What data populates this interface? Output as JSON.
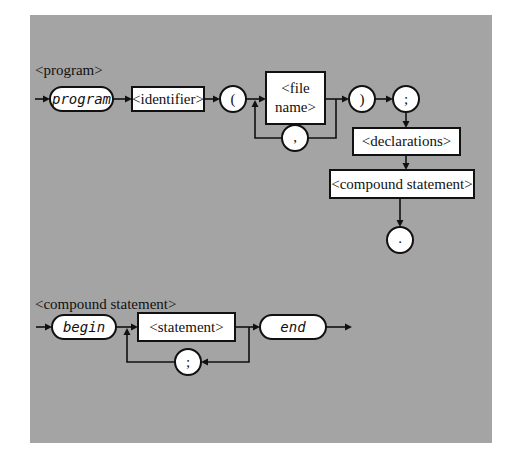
{
  "diagrams": {
    "program": {
      "title": "<program>",
      "keyword": "program",
      "identifier": "<identifier>",
      "open_paren": "(",
      "file_name_line1": "<file",
      "file_name_line2": "name>",
      "comma": ",",
      "close_paren": ")",
      "semicolon": ";",
      "declarations": "<declarations>",
      "compound_statement": "<compound statement>",
      "period": "."
    },
    "compound_statement": {
      "title": "<compound statement>",
      "begin": "begin",
      "statement": "<statement>",
      "separator": ";",
      "end": "end"
    }
  },
  "colors": {
    "panel_background": "#a4a4a4",
    "node_fill": "#ffffff",
    "stroke": "#111111"
  }
}
